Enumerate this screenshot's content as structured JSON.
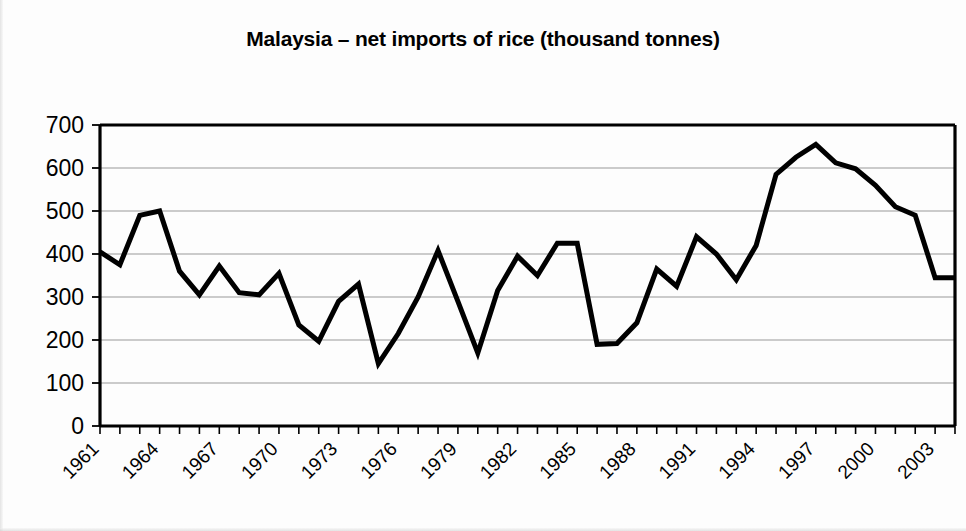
{
  "chart_data": {
    "type": "line",
    "title": "Malaysia – net imports of rice (thousand tonnes)",
    "xlabel": "",
    "ylabel": "",
    "ylim": [
      0,
      700
    ],
    "ytick_step": 100,
    "yticks": [
      0,
      100,
      200,
      300,
      400,
      500,
      600,
      700
    ],
    "ytick_labels": [
      "0",
      "100",
      "200",
      "300",
      "400",
      "500",
      "600",
      "700"
    ],
    "xlim": [
      1961,
      2004
    ],
    "xtick_step": 3,
    "xtick_labels": [
      "1961",
      "1964",
      "1967",
      "1970",
      "1973",
      "1976",
      "1979",
      "1982",
      "1985",
      "1988",
      "1991",
      "1994",
      "1997",
      "2000",
      "2003"
    ],
    "xticks": [
      1961,
      1964,
      1967,
      1970,
      1973,
      1976,
      1979,
      1982,
      1985,
      1988,
      1991,
      1994,
      1997,
      2000,
      2003
    ],
    "xtick_rotation": 45,
    "grid": "horizontal",
    "legend": "none",
    "line_color": "#000000",
    "line_width": 5,
    "markers": "none",
    "x": [
      1961,
      1962,
      1963,
      1964,
      1965,
      1966,
      1967,
      1968,
      1969,
      1970,
      1971,
      1972,
      1973,
      1974,
      1975,
      1976,
      1977,
      1978,
      1979,
      1980,
      1981,
      1982,
      1983,
      1984,
      1985,
      1986,
      1987,
      1988,
      1989,
      1990,
      1991,
      1992,
      1993,
      1994,
      1995,
      1996,
      1997,
      1998,
      1999,
      2000,
      2001,
      2002,
      2003,
      2004
    ],
    "series": [
      {
        "name": "net imports of rice",
        "values": [
          405,
          375,
          490,
          500,
          360,
          305,
          372,
          310,
          305,
          355,
          235,
          197,
          290,
          330,
          145,
          215,
          300,
          408,
          290,
          170,
          315,
          395,
          350,
          425,
          425,
          190,
          192,
          240,
          365,
          325,
          440,
          400,
          340,
          420,
          585,
          625,
          655,
          612,
          598,
          560,
          510,
          490,
          345,
          345
        ]
      }
    ]
  },
  "figure": {
    "plot_area": {
      "left": 100,
      "right": 955,
      "top": 125,
      "bottom": 426
    },
    "background_color": "#ffffff",
    "axis_color": "#000000",
    "gridline_color": "#9a9a9a"
  }
}
